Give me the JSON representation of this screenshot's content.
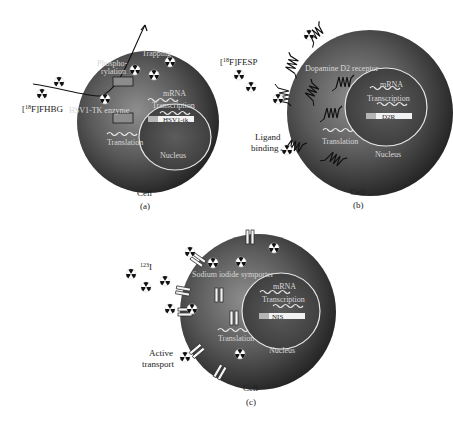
{
  "colors": {
    "cell_center": "#8a8a8a",
    "cell_edge": "#2b2b2b",
    "nucleus_border": "#e6e6e6",
    "internal_text": "#d8d8d8",
    "label_text": "#222222",
    "gene_bar": "#f2f2f2"
  },
  "panels": [
    {
      "id": "a",
      "caption": "(a)",
      "cell_label": "Cell",
      "probe_label_sup": "18",
      "probe_label_main": "F]FHBG",
      "probe_label_open": "[",
      "internal_labels": {
        "phospho_1": "Phospho-",
        "phospho_2": "rylation",
        "trapping": "Trapping",
        "enzyme": "HSV1-TK enzyme",
        "translation": "Translation",
        "mrna": "mRNA",
        "transcription": "Transcription",
        "gene": "HSV1-tk",
        "nucleus": "Nucleus"
      }
    },
    {
      "id": "b",
      "caption": "(b)",
      "cell_label": "Cell",
      "probe_label_sup": "18",
      "probe_label_main": "F]FESP",
      "probe_label_open": "[",
      "outer_label_1": "Ligand",
      "outer_label_2": "binding",
      "internal_labels": {
        "receptor": "Dopamine D2 receptor",
        "translation": "Translation",
        "mrna": "mRNA",
        "transcription": "Transcription",
        "gene": "D2R",
        "nucleus": "Nucleus"
      }
    },
    {
      "id": "c",
      "caption": "(c)",
      "cell_label": "Cell",
      "probe_label_sup": "123",
      "probe_label_main": "I",
      "outer_label_1": "Active",
      "outer_label_2": "transport",
      "internal_labels": {
        "symporter": "Sodium iodide symporter",
        "translation": "Translation",
        "mrna": "mRNA",
        "transcription": "Transcription",
        "gene": "NIS",
        "nucleus": "Nucleus"
      }
    }
  ],
  "icons": {
    "radioactive": "radiation-trefoil-icon"
  }
}
